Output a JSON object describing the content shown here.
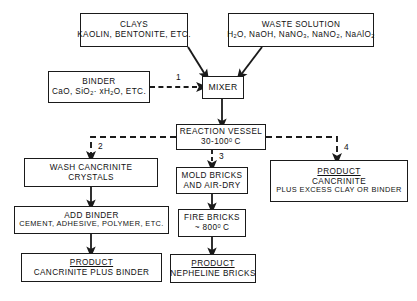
{
  "diagram": {
    "nodes": {
      "clays": {
        "line1": "CLAYS",
        "line2": "KAOLIN, BENTONITE, ETC."
      },
      "waste": {
        "line1": "WASTE SOLUTION",
        "line2_parts": [
          "H",
          "2",
          "O, NaOH, NaNO",
          "3",
          ", NaNO",
          "2",
          ", NaAlO",
          "2"
        ],
        "line2_plain": "H2O, NaOH, NaNO3, NaNO2, NaAlO2"
      },
      "binder": {
        "line1": "BINDER",
        "line2_plain": "CaO, SiO2 · xH2O, ETC."
      },
      "mixer": {
        "line1": "MIXER"
      },
      "reaction_vessel": {
        "line1": "REACTION VESSEL",
        "line2_plain": "30-100° C",
        "temp_value": "30-100",
        "temp_unit": "C"
      },
      "wash": {
        "line1": "WASH CANCRINITE",
        "line2": "CRYSTALS"
      },
      "add_binder": {
        "line1": "ADD BINDER",
        "line2": "CEMENT, ADHESIVE, POLYMER, ETC."
      },
      "product_left": {
        "line1": "PRODUCT",
        "line2": "CANCRINITE PLUS BINDER"
      },
      "mold": {
        "line1": "MOLD BRICKS",
        "line2": "AND AIR-DRY"
      },
      "fire": {
        "line1": "FIRE BRICKS",
        "line2_plain": "~ 800° C",
        "temp_value": "~ 800",
        "temp_unit": "C"
      },
      "product_mid": {
        "line1": "PRODUCT",
        "line2": "NEPHELINE BRICKS"
      },
      "product_right": {
        "line1": "PRODUCT",
        "line2": "CANCRINITE",
        "line3": "PLUS EXCESS CLAY OR BINDER"
      }
    },
    "branch_labels": {
      "b1": "1",
      "b2": "2",
      "b3": "3",
      "b4": "4"
    },
    "colors": {
      "stroke": "#1a1a1a",
      "background": "#ffffff",
      "text": "#111111"
    }
  }
}
